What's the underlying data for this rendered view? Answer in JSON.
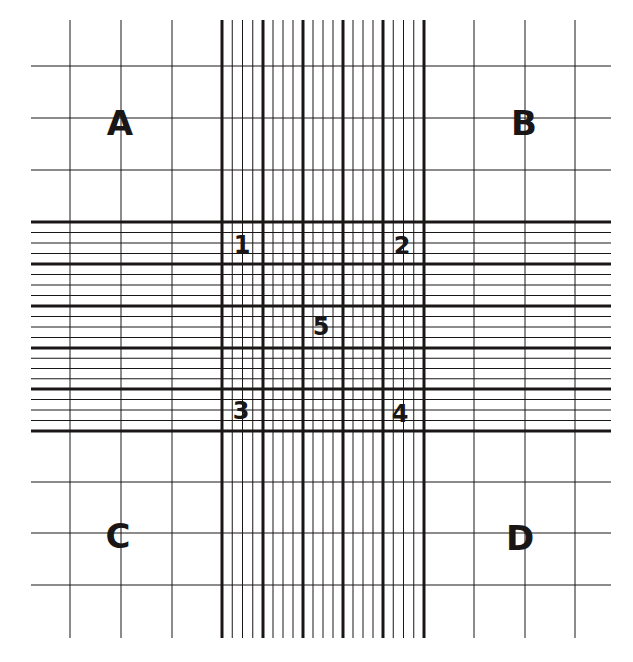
{
  "diagram": {
    "type": "hemocytometer-grid",
    "ink_color": "#1a1616",
    "background": "#ffffff",
    "bounds": {
      "x_start": 31,
      "x_end": 611,
      "y_start": 20,
      "y_end": 638
    },
    "outer_grid": {
      "v_lines_left": [
        70,
        121,
        172
      ],
      "v_lines_right": [
        474,
        525,
        575
      ],
      "h_lines_top": [
        66,
        118,
        170
      ],
      "h_lines_bottom": [
        482,
        533,
        585
      ]
    },
    "central_band": {
      "major_v": [
        222,
        263,
        303,
        343,
        383,
        424
      ],
      "major_h": [
        222,
        264,
        306,
        348,
        389,
        431
      ],
      "minor_per_major": 3
    },
    "large_squares": [
      {
        "label": "A",
        "x": 120,
        "y": 123
      },
      {
        "label": "B",
        "x": 524,
        "y": 123
      },
      {
        "label": "C",
        "x": 118,
        "y": 536
      },
      {
        "label": "D",
        "x": 520,
        "y": 538
      }
    ],
    "small_squares": [
      {
        "label": "1",
        "x": 242,
        "y": 245
      },
      {
        "label": "2",
        "x": 402,
        "y": 246
      },
      {
        "label": "5",
        "x": 321,
        "y": 327
      },
      {
        "label": "3",
        "x": 241,
        "y": 411
      },
      {
        "label": "4",
        "x": 400,
        "y": 414
      }
    ]
  }
}
